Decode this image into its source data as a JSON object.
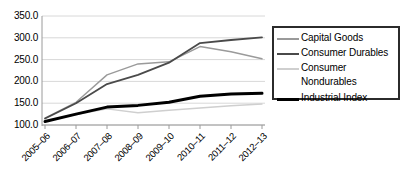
{
  "chart_data": {
    "type": "line",
    "title": "",
    "xlabel": "",
    "ylabel": "",
    "categories": [
      "2005–06",
      "2006–07",
      "2007–08",
      "2008–09",
      "2009–10",
      "2010–11",
      "2011–12",
      "2012–13"
    ],
    "ylim": [
      100.0,
      350.0
    ],
    "yticks": [
      "100.0",
      "150.0",
      "200.0",
      "250.0",
      "300.0",
      "350.0"
    ],
    "ytick_values": [
      100.0,
      150.0,
      200.0,
      250.0,
      300.0,
      350.0
    ],
    "grid": true,
    "legend_position": "right",
    "series": [
      {
        "name": "Capital Goods",
        "color": "#9a9a9a",
        "width": 1.4,
        "values": [
          116,
          152,
          215,
          240,
          245,
          280,
          268,
          252
        ]
      },
      {
        "name": "Consumer Durables",
        "color": "#4a4a4a",
        "width": 1.8,
        "values": [
          115,
          150,
          194,
          215,
          243,
          288,
          295,
          301
        ]
      },
      {
        "name": "Consumer Nondurables",
        "color": "#cfcfcf",
        "width": 1.4,
        "values": [
          109,
          124,
          137,
          128,
          134,
          139,
          144,
          148
        ]
      },
      {
        "name": "Industrial Index",
        "color": "#000000",
        "width": 3.0,
        "values": [
          108,
          125,
          141,
          145,
          152,
          166,
          171,
          173
        ]
      }
    ]
  },
  "legend": {
    "items": [
      {
        "label": "Capital Goods",
        "icon": "line-swatch-capital-goods"
      },
      {
        "label": "Consumer Durables",
        "icon": "line-swatch-consumer-durables"
      },
      {
        "label": "Consumer\nNondurables",
        "icon": "line-swatch-consumer-nondurables"
      },
      {
        "label": "Industrial Index",
        "icon": "line-swatch-industrial-index"
      }
    ]
  },
  "axes": {
    "y_labels": [
      "350.0",
      "300.0",
      "250.0",
      "200.0",
      "150.0",
      "100.0"
    ],
    "x_labels": [
      "2005–06",
      "2006–07",
      "2007–08",
      "2008–09",
      "2009–10",
      "2010–11",
      "2011–12",
      "2012–13"
    ]
  },
  "colors": {
    "axis": "#9a9a9a",
    "grid": "#d8d8d8",
    "legend_border": "#2b2b2b",
    "background": "#ffffff"
  }
}
